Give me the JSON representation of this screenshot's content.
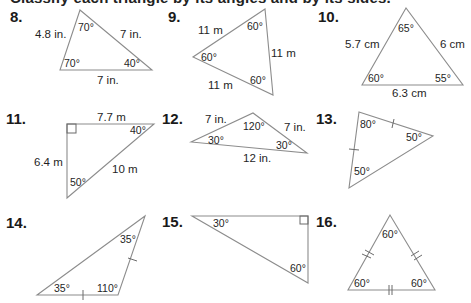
{
  "header": {
    "cut_off_text": "Classify each triangle by its angles and by its sides."
  },
  "problems": [
    {
      "number": "8.",
      "sides": [
        "4.8 in.",
        "7 in.",
        "7 in."
      ],
      "angles": [
        "70°",
        "70°",
        "40°"
      ]
    },
    {
      "number": "9.",
      "sides": [
        "11 m",
        "11 m",
        "11 m"
      ],
      "angles": [
        "60°",
        "60°",
        "60°"
      ]
    },
    {
      "number": "10.",
      "sides": [
        "5.7 cm",
        "6 cm",
        "6.3 cm"
      ],
      "angles": [
        "65°",
        "60°",
        "55°"
      ]
    },
    {
      "number": "11.",
      "sides": [
        "7.7 m",
        "6.4 m",
        "10 m"
      ],
      "angles": [
        "40°",
        "50°"
      ],
      "right_angle": true
    },
    {
      "number": "12.",
      "sides": [
        "7 in.",
        "7 in.",
        "12 in."
      ],
      "angles": [
        "120°",
        "30°",
        "30°"
      ]
    },
    {
      "number": "13.",
      "sides": [],
      "angles": [
        "80°",
        "50°",
        "50°"
      ],
      "congruent_marks": "single tick on two sides"
    },
    {
      "number": "14.",
      "sides": [],
      "angles": [
        "35°",
        "35°",
        "110°"
      ],
      "congruent_marks": "single tick on two sides"
    },
    {
      "number": "15.",
      "sides": [],
      "angles": [
        "30°",
        "60°"
      ],
      "right_angle": true
    },
    {
      "number": "16.",
      "sides": [],
      "angles": [
        "60°",
        "60°",
        "60°"
      ],
      "congruent_marks": "double tick on all three sides"
    }
  ]
}
